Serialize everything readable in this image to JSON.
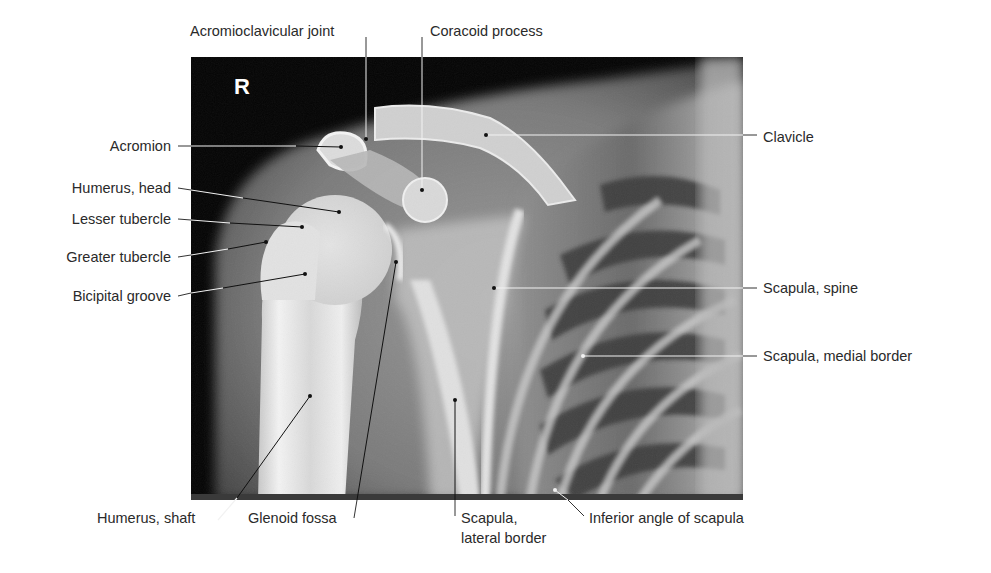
{
  "figure": {
    "type": "labeled radiograph",
    "side_marker": "R",
    "colors": {
      "background": "#ffffff",
      "label_text": "#2a2a2a",
      "leader_line_outside": "#333333",
      "leader_line_on_dark": "#f2f2f2",
      "leader_line_on_light": "#111111",
      "xray_dark": "#050505",
      "xray_bone": "#e6e6e6"
    }
  },
  "labels": {
    "acromioclavicular_joint": "Acromioclavicular joint",
    "coracoid_process": "Coracoid process",
    "clavicle": "Clavicle",
    "acromion": "Acromion",
    "humerus_head": "Humerus, head",
    "lesser_tubercle": "Lesser tubercle",
    "greater_tubercle": "Greater tubercle",
    "bicipital_groove": "Bicipital groove",
    "scapula_spine": "Scapula, spine",
    "scapula_medial_border": "Scapula, medial border",
    "humerus_shaft": "Humerus, shaft",
    "glenoid_fossa": "Glenoid fossa",
    "scapula_lateral_border_line1": "Scapula,",
    "scapula_lateral_border_line2": "lateral border",
    "inferior_angle_of_scapula": "Inferior angle of scapula"
  }
}
